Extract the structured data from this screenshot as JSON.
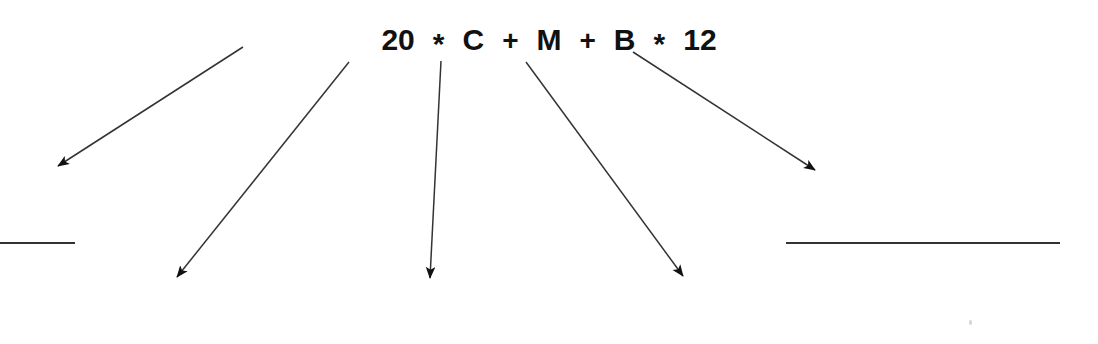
{
  "figure": {
    "background_color": "#ffffff",
    "ink_color": "#111111",
    "line_color": "#333333",
    "width": 1098,
    "height": 344
  },
  "formula": {
    "full_text": "20 * C + M + B * 12",
    "tokens": [
      {
        "text": "20",
        "kind": "number"
      },
      {
        "text": "*",
        "kind": "mul"
      },
      {
        "text": "C",
        "kind": "variable"
      },
      {
        "text": "+",
        "kind": "operator"
      },
      {
        "text": "M",
        "kind": "variable"
      },
      {
        "text": "+",
        "kind": "operator"
      },
      {
        "text": "B",
        "kind": "variable"
      },
      {
        "text": "*",
        "kind": "mul"
      },
      {
        "text": "12",
        "kind": "number"
      }
    ]
  },
  "annotations": {
    "arrows": [
      {
        "id": "arrow-from-20",
        "source_token": "20",
        "x1": 243,
        "y1": 47,
        "x2": 58,
        "y2": 166,
        "direction": "down-left"
      },
      {
        "id": "arrow-from-c",
        "source_token": "C",
        "x1": 349,
        "y1": 62,
        "x2": 177,
        "y2": 277,
        "direction": "down-left"
      },
      {
        "id": "arrow-from-m",
        "source_token": "M",
        "x1": 441,
        "y1": 61,
        "x2": 430,
        "y2": 278,
        "direction": "down"
      },
      {
        "id": "arrow-from-b",
        "source_token": "B",
        "x1": 526,
        "y1": 62,
        "x2": 683,
        "y2": 276,
        "direction": "down-right"
      },
      {
        "id": "arrow-from-12",
        "source_token": "12",
        "x1": 633,
        "y1": 52,
        "x2": 815,
        "y2": 170,
        "direction": "down-right"
      }
    ],
    "rules": [
      {
        "id": "rule-left",
        "x1": 0,
        "y1": 243,
        "x2": 75,
        "y2": 243
      },
      {
        "id": "rule-right",
        "x1": 786,
        "y1": 243,
        "x2": 1060,
        "y2": 243
      }
    ],
    "specks": [
      {
        "id": "speck-lower-right",
        "x": 969,
        "y": 320
      }
    ]
  }
}
